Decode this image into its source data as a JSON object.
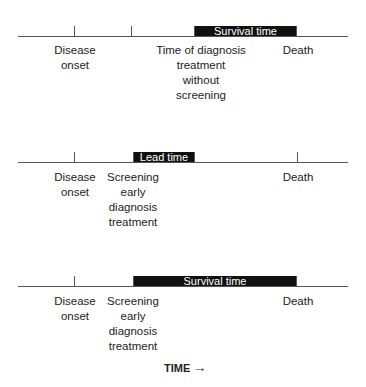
{
  "panels": [
    {
      "name": "without-screening",
      "bar_label": "Survival time",
      "labels": {
        "onset": "Disease\nonset",
        "diagnosis": "Time of diagnosis\ntreatment\nwithout\nscreening",
        "death": "Death"
      }
    },
    {
      "name": "lead-time",
      "bar_label": "Lead time",
      "labels": {
        "onset": "Disease\nonset",
        "screening": "Screening\nearly\ndiagnosis\ntreatment",
        "death": "Death"
      }
    },
    {
      "name": "with-screening",
      "bar_label": "Survival time",
      "labels": {
        "onset": "Disease\nonset",
        "screening": "Screening\nearly\ndiagnosis\ntreatment",
        "death": "Death"
      }
    }
  ],
  "axis_label": "TIME",
  "axis_arrow": "→",
  "colors": {
    "bar": "#111111",
    "line": "#555555",
    "text": "#222222"
  }
}
